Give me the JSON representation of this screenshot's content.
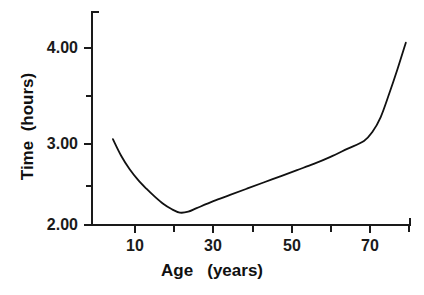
{
  "chart_data": {
    "type": "line",
    "title": "",
    "subtitle": "",
    "xlabel": "Age   (years)",
    "ylabel": "Time  (hours)",
    "xlim": [
      5,
      81
    ],
    "ylim": [
      2.0,
      4.3
    ],
    "grid": false,
    "legend": null,
    "x_major_ticks": [
      10,
      30,
      50,
      70
    ],
    "x_major_tick_labels": [
      "10",
      "30",
      "50",
      "70"
    ],
    "x_minor_ticks": [
      20,
      40,
      60,
      80
    ],
    "y_major_ticks": [
      2.0,
      3.0,
      4.0
    ],
    "y_major_tick_labels": [
      "2.00",
      "3.00",
      "4.00"
    ],
    "y_minor_ticks": [
      2.5,
      3.5
    ],
    "line_color": "#111111",
    "line_width": 1.8,
    "series": [
      {
        "name": "sleep-time-vs-age",
        "x": [
          10,
          12,
          14,
          16,
          18,
          20,
          22,
          24,
          26,
          28,
          30,
          34,
          38,
          42,
          46,
          50,
          54,
          58,
          62,
          66,
          70,
          72,
          74,
          76,
          78,
          80
        ],
        "values": [
          2.97,
          2.78,
          2.63,
          2.51,
          2.41,
          2.32,
          2.24,
          2.18,
          2.14,
          2.15,
          2.19,
          2.27,
          2.34,
          2.41,
          2.48,
          2.55,
          2.62,
          2.69,
          2.77,
          2.86,
          2.95,
          3.05,
          3.22,
          3.48,
          3.76,
          4.06
        ]
      }
    ]
  },
  "axes": {
    "y_labels": [
      "4.00",
      "3.00",
      "2.00"
    ],
    "x_labels": [
      "10",
      "30",
      "50",
      "70"
    ],
    "x_title": "Age   (years)",
    "y_title": "Time  (hours)"
  }
}
